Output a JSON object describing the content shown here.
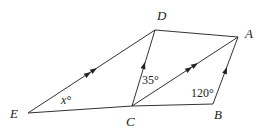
{
  "diagram": {
    "type": "geometry",
    "points": {
      "E": {
        "label": "E",
        "x": 28,
        "y": 113
      },
      "C": {
        "label": "C",
        "x": 132,
        "y": 106
      },
      "B": {
        "label": "B",
        "x": 213,
        "y": 104
      },
      "A": {
        "label": "A",
        "x": 238,
        "y": 37
      },
      "D": {
        "label": "D",
        "x": 155,
        "y": 30
      }
    },
    "segments": [
      {
        "from": "E",
        "to": "D",
        "parallel_marks": 2
      },
      {
        "from": "E",
        "to": "C",
        "parallel_marks": 0
      },
      {
        "from": "C",
        "to": "B",
        "parallel_marks": 0
      },
      {
        "from": "C",
        "to": "D",
        "parallel_marks": 1
      },
      {
        "from": "C",
        "to": "A",
        "parallel_marks": 2
      },
      {
        "from": "D",
        "to": "A",
        "parallel_marks": 0
      },
      {
        "from": "B",
        "to": "A",
        "parallel_marks": 1
      }
    ],
    "angles": {
      "at_E": "x°",
      "at_C": "35°",
      "at_B": "120°"
    }
  }
}
